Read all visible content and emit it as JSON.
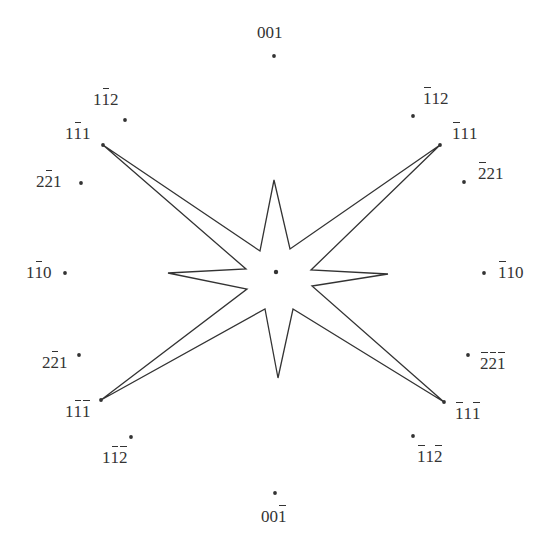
{
  "diagram": {
    "type": "stereographic-projection-star",
    "stroke_color": "#333333",
    "background": "#ffffff",
    "center": {
      "x": 276,
      "y": 272
    },
    "poles": [
      {
        "id": "p001",
        "label": "001",
        "digits": [
          {
            "d": "0",
            "bar": false
          },
          {
            "d": "0",
            "bar": false
          },
          {
            "d": "1",
            "bar": false
          }
        ],
        "dot": [
          274,
          56
        ],
        "text": [
          257,
          24
        ]
      },
      {
        "id": "p1m12",
        "label": "1-12",
        "digits": [
          {
            "d": "1",
            "bar": false
          },
          {
            "d": "1",
            "bar": true
          },
          {
            "d": "2",
            "bar": false
          }
        ],
        "dot": [
          125,
          120
        ],
        "text": [
          93,
          91
        ]
      },
      {
        "id": "p1m11",
        "label": "1-11",
        "digits": [
          {
            "d": "1",
            "bar": false
          },
          {
            "d": "1",
            "bar": true
          },
          {
            "d": "1",
            "bar": false
          }
        ],
        "dot": [
          103,
          145
        ],
        "text": [
          65,
          125
        ]
      },
      {
        "id": "p2m21",
        "label": "2-21",
        "digits": [
          {
            "d": "2",
            "bar": false
          },
          {
            "d": "2",
            "bar": true
          },
          {
            "d": "1",
            "bar": false
          }
        ],
        "dot": [
          81,
          183
        ],
        "text": [
          36,
          173
        ]
      },
      {
        "id": "p1m10",
        "label": "1-10",
        "digits": [
          {
            "d": "1",
            "bar": false
          },
          {
            "d": "1",
            "bar": true
          },
          {
            "d": "0",
            "bar": false
          }
        ],
        "dot": [
          65,
          273
        ],
        "text": [
          26,
          264
        ]
      },
      {
        "id": "p2m2_1",
        "label": "2-21",
        "digits": [
          {
            "d": "2",
            "bar": false
          },
          {
            "d": "2",
            "bar": true
          },
          {
            "d": "1",
            "bar": false
          }
        ],
        "dot": [
          79,
          355
        ],
        "text": [
          42,
          354
        ]
      },
      {
        "id": "p1m1m1",
        "label": "1-1-1",
        "digits": [
          {
            "d": "1",
            "bar": false
          },
          {
            "d": "1",
            "bar": true
          },
          {
            "d": "1",
            "bar": true
          }
        ],
        "dot": [
          101,
          400
        ],
        "text": [
          65,
          403
        ]
      },
      {
        "id": "p1m1m2",
        "label": "1-1-2",
        "digits": [
          {
            "d": "1",
            "bar": false
          },
          {
            "d": "1",
            "bar": true
          },
          {
            "d": "2",
            "bar": true
          }
        ],
        "dot": [
          131,
          437
        ],
        "text": [
          102,
          449
        ]
      },
      {
        "id": "p00m1",
        "label": "00-1",
        "digits": [
          {
            "d": "0",
            "bar": false
          },
          {
            "d": "0",
            "bar": false
          },
          {
            "d": "1",
            "bar": true
          }
        ],
        "dot": [
          275,
          493
        ],
        "text": [
          261,
          508
        ]
      },
      {
        "id": "pm11m2",
        "label": "-11-2",
        "digits": [
          {
            "d": "1",
            "bar": true
          },
          {
            "d": "1",
            "bar": false
          },
          {
            "d": "2",
            "bar": true
          }
        ],
        "dot": [
          413,
          436
        ],
        "text": [
          417,
          448
        ]
      },
      {
        "id": "pm11m1",
        "label": "-11-1",
        "digits": [
          {
            "d": "1",
            "bar": true
          },
          {
            "d": "1",
            "bar": false
          },
          {
            "d": "1",
            "bar": true
          }
        ],
        "dot": [
          444,
          402
        ],
        "text": [
          455,
          405
        ]
      },
      {
        "id": "pm2m2m1",
        "label": "-2-2-1",
        "digits": [
          {
            "d": "2",
            "bar": true
          },
          {
            "d": "2",
            "bar": true
          },
          {
            "d": "1",
            "bar": true
          }
        ],
        "dot": [
          468,
          355
        ],
        "text": [
          480,
          355
        ]
      },
      {
        "id": "pm110",
        "label": "-110",
        "digits": [
          {
            "d": "1",
            "bar": true
          },
          {
            "d": "1",
            "bar": false
          },
          {
            "d": "0",
            "bar": false
          }
        ],
        "dot": [
          484,
          273
        ],
        "text": [
          498,
          264
        ]
      },
      {
        "id": "pm221",
        "label": "-221",
        "digits": [
          {
            "d": "2",
            "bar": true
          },
          {
            "d": "2",
            "bar": false
          },
          {
            "d": "1",
            "bar": false
          }
        ],
        "dot": [
          464,
          182
        ],
        "text": [
          478,
          165
        ]
      },
      {
        "id": "pm111",
        "label": "-111",
        "digits": [
          {
            "d": "1",
            "bar": true
          },
          {
            "d": "1",
            "bar": false
          },
          {
            "d": "1",
            "bar": false
          }
        ],
        "dot": [
          440,
          145
        ],
        "text": [
          452,
          125
        ]
      },
      {
        "id": "pm112",
        "label": "-112",
        "digits": [
          {
            "d": "1",
            "bar": true
          },
          {
            "d": "1",
            "bar": false
          },
          {
            "d": "2",
            "bar": false
          }
        ],
        "dot": [
          413,
          116
        ],
        "text": [
          423,
          90
        ]
      }
    ],
    "star_outline": [
      [
        274,
        180
      ],
      [
        290,
        249
      ],
      [
        440,
        145
      ],
      [
        311,
        270
      ],
      [
        388,
        274
      ],
      [
        312,
        286
      ],
      [
        444,
        402
      ],
      [
        293,
        309
      ],
      [
        278,
        378
      ],
      [
        265,
        309
      ],
      [
        101,
        400
      ],
      [
        247,
        289
      ],
      [
        168,
        273
      ],
      [
        246,
        269
      ],
      [
        103,
        145
      ],
      [
        260,
        251
      ]
    ]
  }
}
